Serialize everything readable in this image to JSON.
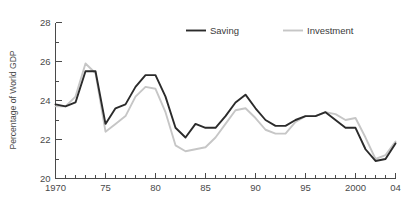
{
  "chart_data": {
    "type": "line",
    "title": "",
    "xlabel": "",
    "ylabel": "Percentage of  World GDP",
    "xlim": [
      1970,
      2004
    ],
    "ylim": [
      20,
      28
    ],
    "grid": false,
    "legend_position": "top-center",
    "y_ticks_major": [
      20,
      22,
      24,
      26,
      28
    ],
    "y_tick_labels": [
      "20",
      "22",
      "24",
      "26",
      "28"
    ],
    "y_ticks_minor": [
      21,
      23,
      25,
      27
    ],
    "x_ticks_major": [
      1970,
      1975,
      1980,
      1985,
      1990,
      1995,
      2000,
      2004
    ],
    "x_tick_labels": [
      "1970",
      "75",
      "80",
      "85",
      "90",
      "95",
      "2000",
      "04"
    ],
    "x_ticks_minor": [
      1971,
      1972,
      1973,
      1974,
      1976,
      1977,
      1978,
      1979,
      1981,
      1982,
      1983,
      1984,
      1986,
      1987,
      1988,
      1989,
      1991,
      1992,
      1993,
      1994,
      1996,
      1997,
      1998,
      1999,
      2001,
      2002,
      2003
    ],
    "x": [
      1970,
      1971,
      1972,
      1973,
      1974,
      1975,
      1976,
      1977,
      1978,
      1979,
      1980,
      1981,
      1982,
      1983,
      1984,
      1985,
      1986,
      1987,
      1988,
      1989,
      1990,
      1991,
      1992,
      1993,
      1994,
      1995,
      1996,
      1997,
      1998,
      1999,
      2000,
      2001,
      2002,
      2003,
      2004
    ],
    "series": [
      {
        "name": "Saving",
        "color": "#2b2b2b",
        "width": 1.9,
        "values": [
          23.8,
          23.7,
          23.9,
          25.5,
          25.5,
          22.8,
          23.6,
          23.8,
          24.7,
          25.3,
          25.3,
          24.2,
          22.6,
          22.1,
          22.8,
          22.6,
          22.6,
          23.2,
          23.9,
          24.3,
          23.6,
          23.0,
          22.7,
          22.7,
          23.0,
          23.2,
          23.2,
          23.4,
          23.0,
          22.6,
          22.6,
          21.5,
          20.9,
          21.0,
          21.8
        ]
      },
      {
        "name": "Investment",
        "color": "#c6c6c6",
        "width": 1.9,
        "values": [
          23.7,
          23.7,
          24.2,
          25.9,
          25.4,
          22.4,
          22.8,
          23.2,
          24.2,
          24.7,
          24.6,
          23.4,
          21.7,
          21.4,
          21.5,
          21.6,
          22.1,
          22.8,
          23.5,
          23.6,
          23.1,
          22.5,
          22.3,
          22.3,
          22.9,
          23.2,
          23.2,
          23.4,
          23.3,
          23.0,
          23.1,
          22.1,
          21.0,
          21.2,
          21.9
        ]
      }
    ]
  },
  "legend": {
    "items": [
      {
        "label": "Saving",
        "color": "#2b2b2b"
      },
      {
        "label": "Investment",
        "color": "#c6c6c6"
      }
    ]
  }
}
